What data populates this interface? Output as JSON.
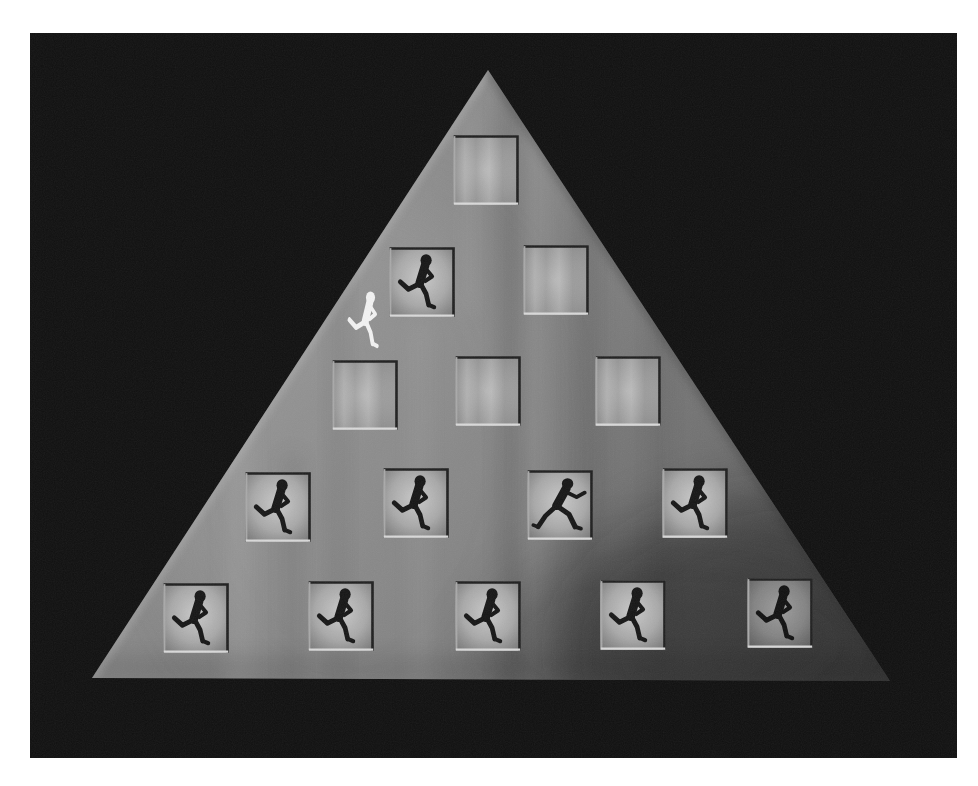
{
  "scene": {
    "kind": "pyramid-tile-game-screen",
    "description": "Gray draped pyramid on black screen with recessed picture tiles",
    "photo_margin": "white"
  },
  "colors": {
    "page": "#ffffff",
    "screen_background": "#101010",
    "pyramid_base": "#808080",
    "pyramid_shadow": "#4f4f4f",
    "tile_center_light": "#c9c9c9",
    "tile_edge_highlight": "#d9d9d9",
    "tile_edge_shadow": "#1f1f1f",
    "runner_silhouette": "#161616",
    "player": "#f2f2f2"
  },
  "board": {
    "shape": "pyramid",
    "tile_count": 15,
    "revealed_runner_tiles": 10,
    "blank_tiles": 5,
    "rows": [
      {
        "index": 1,
        "tiles": [
          {
            "id": "r1c1",
            "state": "blank"
          }
        ]
      },
      {
        "index": 2,
        "tiles": [
          {
            "id": "r2c1",
            "state": "runner"
          },
          {
            "id": "r2c2",
            "state": "blank"
          }
        ]
      },
      {
        "index": 3,
        "tiles": [
          {
            "id": "r3c1",
            "state": "blank"
          },
          {
            "id": "r3c2",
            "state": "blank"
          },
          {
            "id": "r3c3",
            "state": "blank"
          }
        ]
      },
      {
        "index": 4,
        "tiles": [
          {
            "id": "r4c1",
            "state": "runner"
          },
          {
            "id": "r4c2",
            "state": "runner"
          },
          {
            "id": "r4c3",
            "state": "runner-sprinting"
          },
          {
            "id": "r4c4",
            "state": "runner"
          }
        ]
      },
      {
        "index": 5,
        "tiles": [
          {
            "id": "r5c1",
            "state": "runner"
          },
          {
            "id": "r5c2",
            "state": "runner"
          },
          {
            "id": "r5c3",
            "state": "runner"
          },
          {
            "id": "r5c4",
            "state": "runner"
          },
          {
            "id": "r5c5",
            "state": "runner"
          }
        ]
      }
    ]
  },
  "player": {
    "icon": "white-runner-icon",
    "pose": "running",
    "location": "beside tile r2c1, on upper-left slope"
  }
}
